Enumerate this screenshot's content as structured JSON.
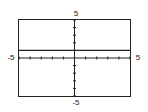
{
  "chart_data": {
    "type": "line",
    "title": "",
    "xlabel": "",
    "ylabel": "",
    "xlim": [
      -5,
      5
    ],
    "ylim": [
      -5,
      5
    ],
    "x_tick_step": 1,
    "y_tick_step": 1,
    "grid": false,
    "series": [
      {
        "name": "y = 1",
        "x": [
          -5,
          5
        ],
        "y": [
          1,
          1
        ]
      }
    ],
    "labels": {
      "x_min": "-5",
      "x_max": "5",
      "y_min": "-5",
      "y_max": "5"
    }
  },
  "colors": {
    "axis": "#222222",
    "frame": "#222222",
    "line": "#222222"
  }
}
